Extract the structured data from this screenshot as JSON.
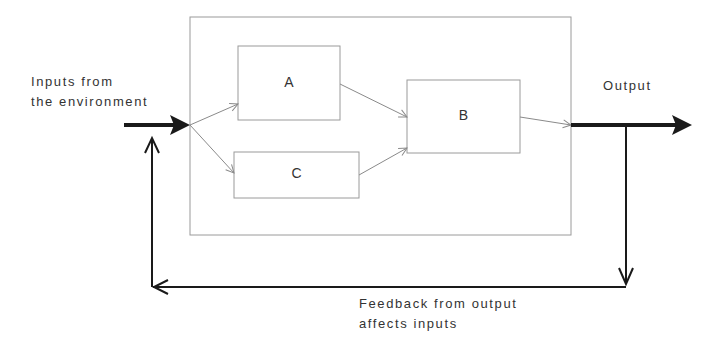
{
  "diagram": {
    "inputs_label": [
      "Inputs from",
      "the environment"
    ],
    "output_label": "Output",
    "feedback_label": [
      "Feedback from output",
      "affects inputs"
    ],
    "boxes": [
      {
        "id": "A",
        "label": "A"
      },
      {
        "id": "B",
        "label": "B"
      },
      {
        "id": "C",
        "label": "C"
      }
    ],
    "colors": {
      "thick_arrow": "#1a1a1a",
      "thin_line": "#8a8a8a",
      "box_border": "#9a9a9a",
      "text": "#333333"
    }
  }
}
